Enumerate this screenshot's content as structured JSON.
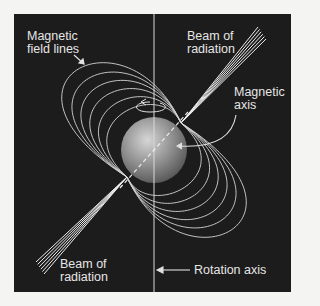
{
  "diagram": {
    "labels": {
      "field_lines": [
        "Magnetic",
        "field lines"
      ],
      "beam_top": [
        "Beam of",
        "radiation"
      ],
      "magnetic_axis": [
        "Magnetic",
        "axis"
      ],
      "beam_bottom": [
        "Beam of",
        "radiation"
      ],
      "rotation_axis": "Rotation axis"
    },
    "colors": {
      "background": "#1c1c1c",
      "page": "#f4f4f2",
      "lines": "#d8d8d8",
      "text": "#e6e6e6",
      "star_light": "#d0d0d0",
      "star_dark": "#555555"
    }
  }
}
